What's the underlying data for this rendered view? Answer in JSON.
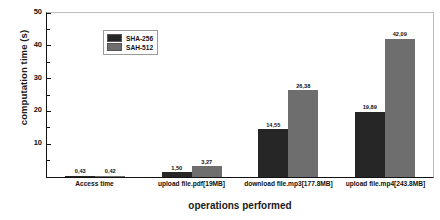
{
  "chart_data": {
    "type": "bar",
    "title": "",
    "xlabel": "operations performed",
    "ylabel": "computation time (s)",
    "ylim": [
      0,
      50
    ],
    "yticks": [
      0,
      10,
      20,
      30,
      40,
      50
    ],
    "ytick_labels": [
      "0",
      "10",
      "20",
      "30",
      "40",
      "50"
    ],
    "grid": false,
    "legend_position": "upper-left",
    "categories": [
      "Access time",
      "upload file.pdf[19MB]",
      "download file.mp3[177.8MB]",
      "upload file.mp4[243.8MB]"
    ],
    "series": [
      {
        "name": "SHA-256",
        "color": "#262626",
        "values": [
          0.43,
          1.5,
          14.55,
          19.89
        ],
        "value_labels": [
          "0,43",
          "1,50",
          "14,55",
          "19,89"
        ]
      },
      {
        "name": "SAH-512",
        "color": "#6e6e6e",
        "values": [
          0.42,
          3.27,
          26.38,
          42.09
        ],
        "value_labels": [
          "0,42",
          "3,27",
          "26,38",
          "42,09"
        ]
      }
    ]
  }
}
